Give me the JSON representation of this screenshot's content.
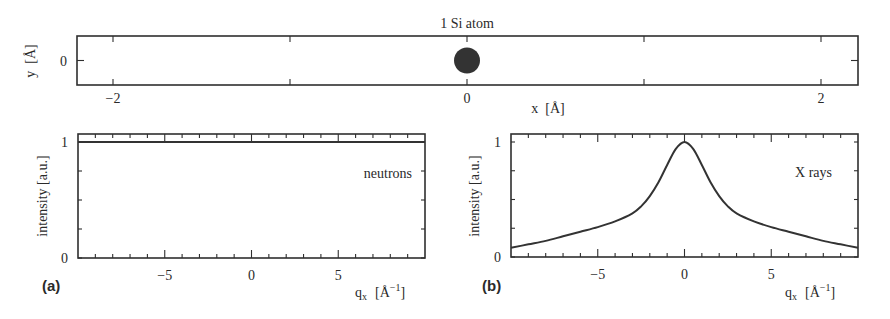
{
  "chart_data": [
    {
      "id": "top",
      "type": "scatter",
      "title": "1 Si atom",
      "xlabel": "x  [Å]",
      "ylabel": "y  [Å]",
      "xlim": [
        -2.3,
        2.1
      ],
      "ylim": [
        -0.5,
        0.5
      ],
      "xticks": [
        -2,
        -1,
        0,
        1,
        2
      ],
      "xtick_labels": [
        "−2",
        "",
        "0",
        "",
        "2"
      ],
      "yticks": [
        0
      ],
      "ytick_labels": [
        "0"
      ],
      "points": [
        {
          "x": 0,
          "y": 0,
          "label": "Si"
        }
      ],
      "grid": false
    },
    {
      "id": "a",
      "panel_label": "(a)",
      "type": "line",
      "xlabel": "q",
      "xlabel_sub": "x",
      "xlabel_unit": "[Å",
      "xlabel_sup": "−1",
      "xlabel_close": "]",
      "ylabel": "intensity [a.u.]",
      "xlim": [
        -10,
        10
      ],
      "ylim": [
        0,
        1.07
      ],
      "xticks_major": [
        -5,
        0,
        5
      ],
      "xtick_labels": [
        "−5",
        "0",
        "5"
      ],
      "xticks_minor_step": 1,
      "yticks": [
        0,
        0.25,
        0.5,
        0.75,
        1
      ],
      "ytick_labels": [
        "0",
        "",
        "",
        "",
        "1"
      ],
      "annotation": "neutrons",
      "series": [
        {
          "name": "neutrons",
          "x": [
            -10,
            10
          ],
          "y": [
            1,
            1
          ]
        }
      ],
      "grid": false
    },
    {
      "id": "b",
      "panel_label": "(b)",
      "type": "line",
      "xlabel": "q",
      "xlabel_sub": "x",
      "xlabel_unit": "[Å",
      "xlabel_sup": "−1",
      "xlabel_close": "]",
      "ylabel": "intensity [a.u.]",
      "xlim": [
        -10,
        10
      ],
      "ylim": [
        0,
        1.07
      ],
      "xticks_major": [
        -5,
        0,
        5
      ],
      "xtick_labels": [
        "−5",
        "0",
        "5"
      ],
      "xticks_minor_step": 1,
      "yticks": [
        0,
        0.25,
        0.5,
        0.75,
        1
      ],
      "ytick_labels": [
        "0",
        "",
        "",
        "",
        "1"
      ],
      "annotation": "X rays",
      "series": [
        {
          "name": "X rays",
          "x": [
            -10,
            -9,
            -8,
            -7,
            -6,
            -5,
            -4,
            -3,
            -2.5,
            -2,
            -1.5,
            -1,
            -0.5,
            0,
            0.5,
            1,
            1.5,
            2,
            2.5,
            3,
            4,
            5,
            6,
            7,
            8,
            9,
            10
          ],
          "y": [
            0.08,
            0.11,
            0.14,
            0.18,
            0.22,
            0.26,
            0.31,
            0.38,
            0.44,
            0.53,
            0.65,
            0.8,
            0.94,
            1.0,
            0.94,
            0.8,
            0.65,
            0.53,
            0.44,
            0.38,
            0.31,
            0.26,
            0.22,
            0.18,
            0.14,
            0.11,
            0.08
          ]
        }
      ],
      "grid": false
    }
  ]
}
